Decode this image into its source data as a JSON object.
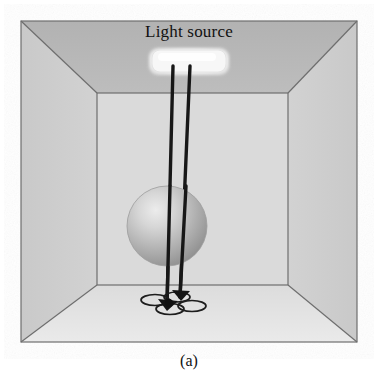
{
  "figure": {
    "caption": "(a)",
    "scene_type": "3d-room-perspective-diagram",
    "labels": {
      "light_source": "Light source"
    }
  },
  "colors": {
    "background": "#ffffff",
    "ceiling": "#b6b6b6",
    "left_wall": "#c6c6c6",
    "right_wall": "#c6c6c6",
    "back_wall": "#d8d8d8",
    "floor": "#e2e2e2",
    "outline": "#6b6b6b",
    "ray_line": "#1a1a1a",
    "light_fixture_fill": "#f5f5f5",
    "light_fixture_edge": "#e8e8e8",
    "sphere_light": "#e9e9e9",
    "sphere_mid": "#b9b9b9",
    "sphere_dark": "#8f8f8f",
    "drone_body": "#141414",
    "drone_ring": "#1a1a1a",
    "text": "#111111"
  },
  "geometry": {
    "outer_box": {
      "x": 21,
      "y": 21,
      "width": 336,
      "height": 321
    },
    "inner_back_wall": {
      "left": 97,
      "top": 93,
      "right": 288,
      "bottom": 285
    },
    "light_fixture": {
      "cx": 189,
      "cy": 62,
      "rx": 38,
      "ry": 12
    },
    "sphere": {
      "cx": 167,
      "cy": 226,
      "r": 40
    },
    "drone": {
      "cx": 172,
      "cy": 302
    },
    "rays": [
      {
        "name": "ray-left",
        "from_x": 173,
        "from_y": 66,
        "to_x": 167,
        "to_y": 305
      },
      {
        "name": "ray-right",
        "from_x": 190,
        "from_y": 66,
        "to_x": 180,
        "to_y": 297
      }
    ]
  }
}
